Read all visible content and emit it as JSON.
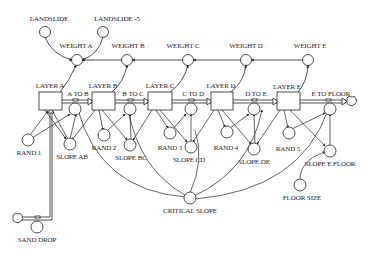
{
  "diagram": {
    "type": "stock-and-flow",
    "top_inputs": [
      {
        "id": "landslide",
        "label": "LANDSLIDE"
      },
      {
        "id": "landslide5",
        "label": "LANDSLIDE -5"
      }
    ],
    "weights": [
      {
        "id": "wa",
        "label": "WEIGHT A"
      },
      {
        "id": "wb",
        "label": "WEIGHT B"
      },
      {
        "id": "wc",
        "label": "WEIGHT C"
      },
      {
        "id": "wd",
        "label": "WEIGHT D"
      },
      {
        "id": "we",
        "label": "WEIGHT E"
      }
    ],
    "stocks": [
      {
        "id": "la",
        "label": "LAYER A"
      },
      {
        "id": "lb",
        "label": "LAYER B"
      },
      {
        "id": "lc",
        "label": "LAYER C"
      },
      {
        "id": "ld",
        "label": "LAYER D"
      },
      {
        "id": "le",
        "label": "LAYER E"
      }
    ],
    "flows": [
      {
        "id": "atob",
        "label": "A TO B"
      },
      {
        "id": "btoc",
        "label": "B TO C"
      },
      {
        "id": "ctod",
        "label": "C TO D"
      },
      {
        "id": "dtoe",
        "label": "D TO E"
      },
      {
        "id": "etofloor",
        "label": "E TO FLOOR"
      }
    ],
    "rands": [
      {
        "id": "r1",
        "label": "RAND 1"
      },
      {
        "id": "r2",
        "label": "RAND 2"
      },
      {
        "id": "r3",
        "label": "RAND 3"
      },
      {
        "id": "r4",
        "label": "RAND 4"
      },
      {
        "id": "r5",
        "label": "RAND 5"
      }
    ],
    "slopes": [
      {
        "id": "sab",
        "label": "SLOPE AB"
      },
      {
        "id": "sbc",
        "label": "SLOPE BC"
      },
      {
        "id": "scd",
        "label": "SLOPE CD"
      },
      {
        "id": "sde",
        "label": "SLOPE DE"
      },
      {
        "id": "sef",
        "label": "SLOPE E FLOOR"
      }
    ],
    "critical_slope": {
      "label": "CRITICAL SLOPE"
    },
    "floor_size": {
      "label": "FLOOR SIZE"
    },
    "sand_drop": {
      "label": "SAND DROP"
    },
    "colors": {
      "line": "#222222",
      "background": "#ffffff"
    }
  }
}
